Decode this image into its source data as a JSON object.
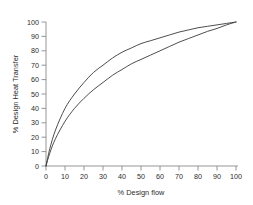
{
  "chart_data": {
    "type": "line",
    "title": "",
    "xlabel": "% Design flow",
    "ylabel": "% Design Heat Transfer",
    "xlim": [
      0,
      100
    ],
    "ylim": [
      0,
      100
    ],
    "xticks": [
      0,
      10,
      20,
      30,
      40,
      50,
      60,
      70,
      80,
      90,
      100
    ],
    "yticks": [
      0,
      10,
      20,
      30,
      40,
      50,
      60,
      70,
      80,
      90,
      100
    ],
    "grid": false,
    "legend": "none",
    "x": [
      0,
      2,
      5,
      10,
      15,
      20,
      25,
      30,
      35,
      40,
      45,
      50,
      55,
      60,
      65,
      70,
      75,
      80,
      85,
      90,
      95,
      100
    ],
    "series": [
      {
        "name": "upper-curve",
        "color": "#3a3a3a",
        "values": [
          0,
          12,
          25,
          40,
          50,
          58,
          65,
          70,
          75,
          79,
          82,
          85,
          87,
          89,
          91,
          93,
          94.5,
          96,
          97,
          98,
          99,
          100
        ]
      },
      {
        "name": "lower-curve",
        "color": "#3a3a3a",
        "values": [
          0,
          9,
          19,
          31,
          40,
          47,
          53,
          58,
          63,
          67,
          71,
          74,
          77,
          80,
          83,
          86,
          88.5,
          91,
          93.5,
          95.5,
          98,
          100
        ]
      }
    ]
  },
  "axes": {
    "x_title": "% Design flow",
    "y_title": "% Design Heat Transfer",
    "x_tick_labels": [
      "0",
      "10",
      "20",
      "30",
      "40",
      "50",
      "60",
      "70",
      "80",
      "90",
      "100"
    ],
    "y_tick_labels": [
      "0",
      "10",
      "20",
      "30",
      "40",
      "50",
      "60",
      "70",
      "80",
      "90",
      "100"
    ],
    "axis_color": "#8a8a8a",
    "curve_color": "#3a3a3a",
    "background_color": "#ffffff"
  }
}
